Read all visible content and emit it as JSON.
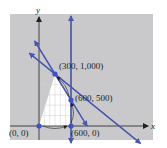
{
  "diagram": {
    "type": "feasible-region",
    "axis_labels": {
      "x": "x",
      "y": "y"
    },
    "colors": {
      "background_panel": "#c9c9cb",
      "feasible_region": "#ffffff",
      "constraint_line": "#4a57b0",
      "vertex": "#3d52c4",
      "axis": "#222222"
    },
    "vertices": [
      {
        "x": 0,
        "y": 0,
        "label": "(0, 0)"
      },
      {
        "x": 600,
        "y": 0,
        "label": "(600, 0)"
      },
      {
        "x": 600,
        "y": 500,
        "label": "(600, 500)"
      },
      {
        "x": 300,
        "y": 1000,
        "label": "(300, 1,000)"
      }
    ],
    "constraint_lines": [
      {
        "name": "x = 600",
        "type": "vertical",
        "x": 600
      },
      {
        "name": "steep line through (300,1000) and (600,500)",
        "points": [
          [
            300,
            1000
          ],
          [
            600,
            500
          ]
        ]
      },
      {
        "name": "shallow line through (300,1000)",
        "points": [
          [
            300,
            1000
          ],
          [
            1200,
            250
          ]
        ]
      }
    ],
    "path_arrows": [
      {
        "from": [
          0,
          0
        ],
        "to": [
          600,
          0
        ]
      },
      {
        "from": [
          600,
          0
        ],
        "to": [
          600,
          500
        ]
      },
      {
        "from": [
          600,
          500
        ],
        "to": [
          300,
          1000
        ]
      }
    ]
  }
}
